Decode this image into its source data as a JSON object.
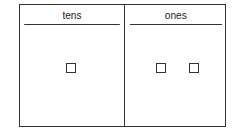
{
  "diagram": {
    "type": "place-value-chart",
    "columns": [
      {
        "label": "tens",
        "count": 1
      },
      {
        "label": "ones",
        "count": 2
      }
    ],
    "line_color": "#333333",
    "text_color": "#222222",
    "represented_number": 12
  }
}
